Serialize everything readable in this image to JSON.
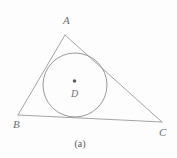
{
  "figure": {
    "caption": "(a)",
    "stroke_color": "#9a9a9a",
    "label_color": "#6e6e6e",
    "background_color": "#fdfdfd",
    "vertices": [
      {
        "id": "A",
        "label": "A",
        "x": 65,
        "y": 35,
        "label_x": 63,
        "label_y": 24
      },
      {
        "id": "B",
        "label": "B",
        "x": 18,
        "y": 115,
        "label_x": 13,
        "label_y": 128
      },
      {
        "id": "C",
        "label": "C",
        "x": 162,
        "y": 122,
        "label_x": 159,
        "label_y": 136
      }
    ],
    "edges": [
      {
        "id": "AB",
        "from": "A",
        "to": "B"
      },
      {
        "id": "BC",
        "from": "B",
        "to": "C"
      },
      {
        "id": "CA",
        "from": "C",
        "to": "A"
      }
    ],
    "incircle": {
      "center_label": "D",
      "cx": 75,
      "cy": 85,
      "r": 32,
      "center_label_x": 71,
      "center_label_y": 97,
      "dot_r": 1.8,
      "dot_cx": 74.5,
      "dot_cy": 81
    },
    "caption_x": 80,
    "caption_y": 147
  }
}
